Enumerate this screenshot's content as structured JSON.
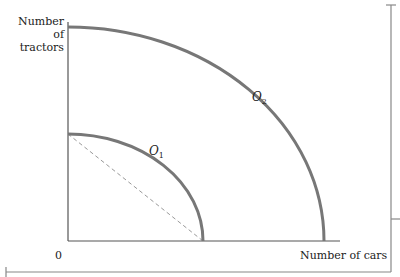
{
  "diagram": {
    "type": "production possibilities frontiers",
    "y_axis_label": "Number of tractors",
    "y_axis_label_lines": [
      "Number",
      "of",
      "tractors"
    ],
    "x_axis_label": "Number of cars",
    "origin_label": "0",
    "curves": [
      {
        "name": "O1",
        "letter": "O",
        "subscript": "1",
        "color": "#777777"
      },
      {
        "name": "O2",
        "letter": "O",
        "subscript": "2",
        "color": "#777777"
      }
    ],
    "dashed_line": {
      "from": "O1 y-intercept",
      "to": "O1 x-intercept",
      "color": "#999999"
    },
    "colors": {
      "axis": "#555555",
      "curve": "#777777",
      "frame": "#777777"
    }
  }
}
